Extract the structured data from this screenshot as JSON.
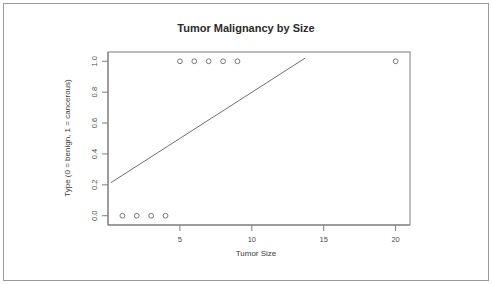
{
  "figure": {
    "title": "Tumor Malignancy by Size",
    "x_axis_title": "Tumor Size",
    "y_axis_title": "Type (0 = benign, 1 = cancerous)"
  },
  "chart_data": {
    "type": "scatter",
    "title": "Tumor Malignancy by Size",
    "xlabel": "Tumor Size",
    "ylabel": "Type (0 = benign, 1 = cancerous)",
    "xlim": [
      0,
      21
    ],
    "ylim": [
      -0.06,
      1.06
    ],
    "grid": false,
    "legend": false,
    "x_ticks": [
      5,
      10,
      15,
      20
    ],
    "x_tick_labels": [
      "5",
      "10",
      "15",
      "20"
    ],
    "y_ticks": [
      0.0,
      0.2,
      0.4,
      0.6,
      0.8,
      1.0
    ],
    "y_tick_labels": [
      "0.0",
      "0.2",
      "0.4",
      "0.6",
      "0.8",
      "1.0"
    ],
    "series": [
      {
        "name": "observations",
        "marker": "open-circle",
        "x": [
          1,
          2,
          3,
          4,
          5,
          6,
          7,
          8,
          9,
          20
        ],
        "y": [
          0,
          0,
          0,
          0,
          1,
          1,
          1,
          1,
          1,
          1
        ]
      },
      {
        "name": "linear fit",
        "type": "line",
        "x": [
          0.2,
          13.7
        ],
        "y": [
          0.214,
          1.02
        ]
      }
    ]
  }
}
